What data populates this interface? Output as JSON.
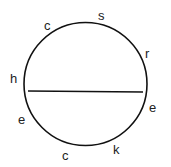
{
  "diagram": {
    "type": "circle-with-chord",
    "letters": [
      {
        "char": "c",
        "x": 44,
        "y": 30
      },
      {
        "char": "s",
        "x": 98,
        "y": 20
      },
      {
        "char": "r",
        "x": 145,
        "y": 58
      },
      {
        "char": "h",
        "x": 10,
        "y": 83
      },
      {
        "char": "e",
        "x": 149,
        "y": 112
      },
      {
        "char": "e",
        "x": 18,
        "y": 124
      },
      {
        "char": "c",
        "x": 62,
        "y": 160
      },
      {
        "char": "k",
        "x": 113,
        "y": 154
      }
    ]
  }
}
